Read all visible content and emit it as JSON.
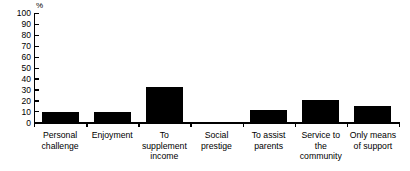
{
  "chart_data": {
    "type": "bar",
    "title": "",
    "subtitle": "",
    "xlabel": "",
    "ylabel": "%",
    "unit_label": "%",
    "categories": [
      "Personal challenge",
      "Enjoyment",
      "To supplement income",
      "Social prestige",
      "To assist parents",
      "Service to the community",
      "Only means of support"
    ],
    "values": [
      9,
      9,
      32,
      0,
      11,
      20,
      15
    ],
    "ylim": [
      0,
      100
    ],
    "yticks": [
      0,
      10,
      20,
      30,
      40,
      50,
      60,
      70,
      80,
      90,
      100
    ],
    "ytick_labels": [
      "0",
      "10",
      "20",
      "30",
      "40",
      "50",
      "60",
      "70",
      "80",
      "90",
      "100"
    ],
    "grid": false,
    "legend": false,
    "legend_position": "none",
    "bar_color": "#000000",
    "axis_color": "#000000",
    "background_color": "#ffffff"
  },
  "category_lines": [
    [
      "Personal",
      "challenge"
    ],
    [
      "Enjoyment"
    ],
    [
      "To",
      "supplement",
      "income"
    ],
    [
      "Social",
      "prestige"
    ],
    [
      "To assist",
      "parents"
    ],
    [
      "Service to",
      "the",
      "community"
    ],
    [
      "Only means",
      "of support"
    ]
  ],
  "ytick_text": {
    "t100": "100",
    "t90": "90",
    "t80": "80",
    "t70": "70",
    "t60": "60",
    "t50": "50",
    "t40": "40",
    "t30": "30",
    "t20": "20",
    "t10": "10",
    "t0": "0"
  }
}
